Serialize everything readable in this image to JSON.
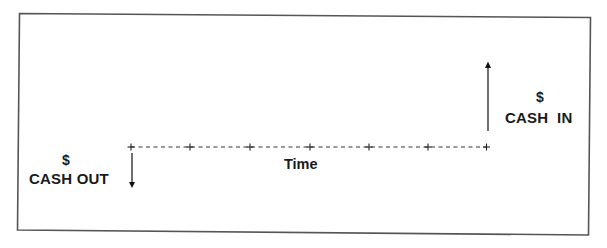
{
  "diagram": {
    "type": "cash-flow-timeline",
    "colors": {
      "background": "#ffffff",
      "border": "#555555",
      "ink": "#1a1a1a"
    },
    "timeline": {
      "label": "Time",
      "tick_count": 7,
      "tick_glyph": "+",
      "line_style": "dashed"
    },
    "cash_out": {
      "currency_symbol": "$",
      "label": "CASH OUT",
      "arrow_direction": "down",
      "position": "start"
    },
    "cash_in": {
      "currency_symbol": "$",
      "label": "CASH  IN",
      "arrow_direction": "up",
      "position": "end"
    }
  }
}
